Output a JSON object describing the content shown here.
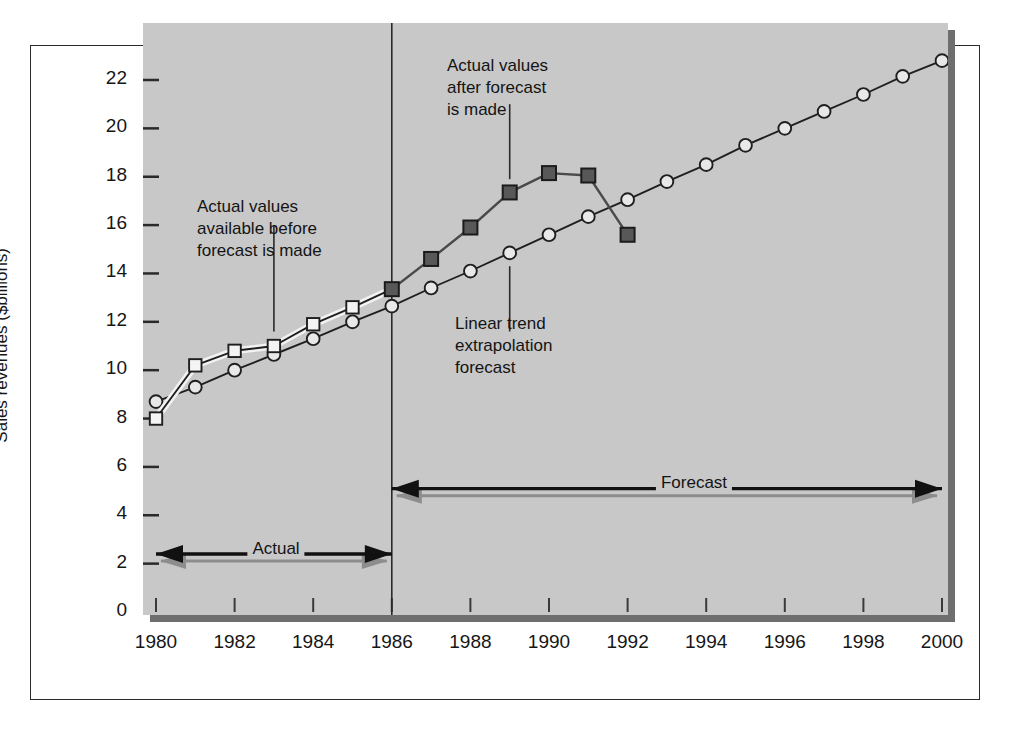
{
  "figure": {
    "background_color": "#ffffff",
    "plot_background_color": "#c8c8c8",
    "plot_shadow_color": "#6e6e6e"
  },
  "chart_data": {
    "type": "line",
    "title": "",
    "xlabel": "",
    "ylabel": "Sales revenues ($billions)",
    "xlim": [
      1980,
      2000
    ],
    "ylim": [
      0,
      23
    ],
    "xticks": [
      1980,
      1982,
      1984,
      1986,
      1988,
      1990,
      1992,
      1994,
      1996,
      1998,
      2000
    ],
    "xticklabels": [
      "1980",
      "1982",
      "1984",
      "1986",
      "1988",
      "1990",
      "1992",
      "1994",
      "1996",
      "1998",
      "2000"
    ],
    "yticks": [
      0,
      2,
      4,
      6,
      8,
      10,
      12,
      14,
      16,
      18,
      20,
      22
    ],
    "yticklabels": [
      "0",
      "2",
      "4",
      "6",
      "8",
      "10",
      "12",
      "14",
      "16",
      "18",
      "20",
      "22"
    ],
    "grid": false,
    "legend": "none",
    "forecast_origin_year": 1986,
    "series": [
      {
        "name": "Linear trend extrapolation forecast",
        "marker": "open-circle",
        "color": "#1f1f1f",
        "x": [
          1980,
          1981,
          1982,
          1983,
          1984,
          1985,
          1986,
          1987,
          1988,
          1989,
          1990,
          1991,
          1992,
          1993,
          1994,
          1995,
          1996,
          1997,
          1998,
          1999,
          2000
        ],
        "values": [
          8.7,
          9.3,
          10.0,
          10.65,
          11.3,
          12.0,
          12.65,
          13.4,
          14.1,
          14.85,
          15.6,
          16.35,
          17.05,
          17.8,
          18.5,
          19.3,
          20.0,
          20.7,
          21.4,
          22.15,
          22.8
        ]
      },
      {
        "name": "Actual values available before forecast is made",
        "marker": "open-square",
        "color": "#1f1f1f",
        "x": [
          1980,
          1981,
          1982,
          1983,
          1984,
          1985,
          1986
        ],
        "values": [
          8.0,
          10.2,
          10.8,
          11.0,
          11.9,
          12.6,
          13.35
        ]
      },
      {
        "name": "Actual values after forecast is made",
        "marker": "filled-square",
        "color": "#4a4a4a",
        "x": [
          1986,
          1987,
          1988,
          1989,
          1990,
          1991,
          1992
        ],
        "values": [
          13.35,
          14.6,
          15.9,
          17.35,
          18.15,
          18.05,
          15.6
        ]
      }
    ],
    "annotations": [
      {
        "id": "actual-before",
        "text": "Actual values\navailable before\nforecast is made",
        "points_to_year": 1983,
        "points_to_value": 11.0
      },
      {
        "id": "actual-after",
        "text": "Actual values\nafter forecast\nis made",
        "points_to_year": 1989,
        "points_to_value": 17.35
      },
      {
        "id": "linear-trend",
        "text": "Linear trend\nextrapolation\nforecast",
        "points_to_year": 1989,
        "points_to_value": 14.85
      }
    ],
    "span_markers": [
      {
        "id": "actual-span",
        "label": "Actual",
        "from_year": 1980,
        "to_year": 1986,
        "at_value": 2.4
      },
      {
        "id": "forecast-span",
        "label": "Forecast",
        "from_year": 1986,
        "to_year": 2000,
        "at_value": 5.1
      }
    ]
  }
}
